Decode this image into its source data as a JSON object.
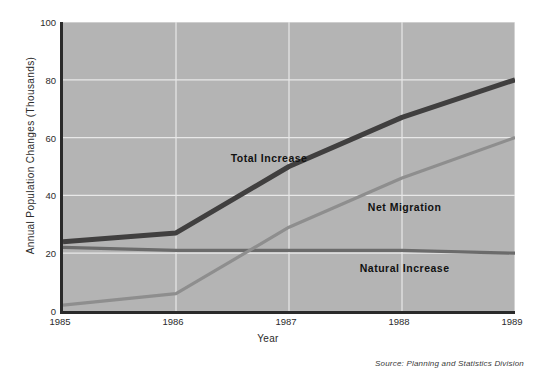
{
  "chart_data": {
    "type": "line",
    "title": "",
    "xlabel": "Year",
    "ylabel": "Annual Population Changes (Thousands)",
    "categories": [
      "1985",
      "1986",
      "1987",
      "1988",
      "1989"
    ],
    "x": [
      1985,
      1986,
      1987,
      1988,
      1989
    ],
    "xlim": [
      1985,
      1989
    ],
    "ylim": [
      0,
      100
    ],
    "yticks": [
      0,
      20,
      40,
      60,
      80,
      100
    ],
    "xticks": [
      "1985",
      "1986",
      "1987",
      "1988",
      "1989"
    ],
    "grid": true,
    "grid_color": "#e8e8e8",
    "plot_background": "#b4b4b4",
    "legend": "inline-labels",
    "series": [
      {
        "name": "Total Increase",
        "values": [
          24,
          27,
          50,
          67,
          80
        ],
        "color": "#403f3f",
        "width": 5
      },
      {
        "name": "Natural Increase",
        "values": [
          22,
          21,
          21,
          21,
          20
        ],
        "color": "#6b6b6b",
        "width": 3.2
      },
      {
        "name": "Net Migration",
        "values": [
          2,
          6,
          29,
          46,
          60
        ],
        "color": "#8e8e8e",
        "width": 3.2
      }
    ],
    "annotations": [
      {
        "text": "Total Increase",
        "x": 1986.85,
        "y": 53
      },
      {
        "text": "Net Migration",
        "x": 1988.05,
        "y": 36
      },
      {
        "text": "Natural Increase",
        "x": 1988.05,
        "y": 15
      }
    ],
    "source_note": "Source: Planning and Statistics Division"
  }
}
